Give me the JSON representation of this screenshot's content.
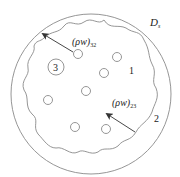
{
  "diagram": {
    "domain_label": "D",
    "domain_subscript": "s",
    "region_labels": {
      "inner": "1",
      "outer": "2",
      "particle": "3"
    },
    "flux_32": {
      "base": "(ρw)",
      "sub": "32"
    },
    "flux_23": {
      "base": "(ρw)",
      "sub": "23"
    },
    "colors": {
      "stroke": "#8a8a8a",
      "text": "#222222",
      "arrow": "#333333"
    }
  }
}
